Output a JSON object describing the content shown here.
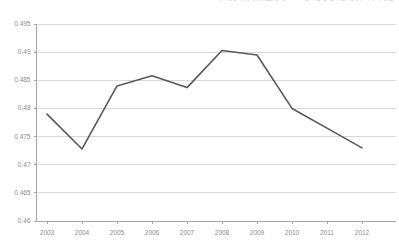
{
  "title_fragment": "年份城镇居民人均可支配收入占比",
  "colors": {
    "line": "#595959",
    "grid": "#d9d9d9",
    "axis": "#a6a6a6",
    "text": "#8c8c8c",
    "background": "#ffffff"
  },
  "chart_data": {
    "type": "line",
    "title": "",
    "xlabel": "",
    "ylabel": "",
    "categories": [
      "2003",
      "2004",
      "2005",
      "2006",
      "2007",
      "2008",
      "2009",
      "2010",
      "2011",
      "2012"
    ],
    "x": [
      2003,
      2004,
      2005,
      2006,
      2007,
      2008,
      2009,
      2010,
      2011,
      2012
    ],
    "values": [
      0.479,
      0.4728,
      0.484,
      0.4858,
      0.4837,
      0.4903,
      0.4895,
      0.48,
      0.4765,
      0.473
    ],
    "series": [
      {
        "name": "series-1",
        "values": [
          0.479,
          0.4728,
          0.484,
          0.4858,
          0.4837,
          0.4903,
          0.4895,
          0.48,
          0.4765,
          0.473
        ]
      }
    ],
    "ylim": [
      0.46,
      0.495
    ],
    "ytick_labels": [
      "0.495",
      "0.49",
      "0.485",
      "0.48",
      "0.475",
      "0.47",
      "0.465",
      "0.46"
    ],
    "ytick_values": [
      0.495,
      0.49,
      0.485,
      0.48,
      0.475,
      0.47,
      0.465,
      0.46
    ],
    "ystep": 0.005,
    "grid": true,
    "grid_axis": "y",
    "legend": false,
    "legend_position": "none",
    "markers": false,
    "annotations": []
  }
}
